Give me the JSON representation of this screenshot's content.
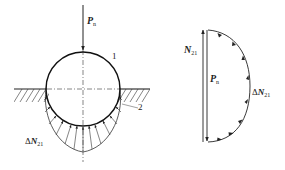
{
  "left_figure": {
    "force_label": {
      "symbol": "P",
      "subscript": "n"
    },
    "body_1_label": "1",
    "body_2_label": "2",
    "distributed_load_label": {
      "prefix": "Δ",
      "symbol": "N",
      "subscript": "21"
    }
  },
  "right_figure": {
    "resultant_label": {
      "symbol": "N",
      "subscript": "21"
    },
    "force_label": {
      "symbol": "P",
      "subscript": "n"
    },
    "distributed_load_label": {
      "prefix": "Δ",
      "symbol": "N",
      "subscript": "21"
    }
  },
  "colors": {
    "stroke": "#222222",
    "background": "#ffffff"
  }
}
